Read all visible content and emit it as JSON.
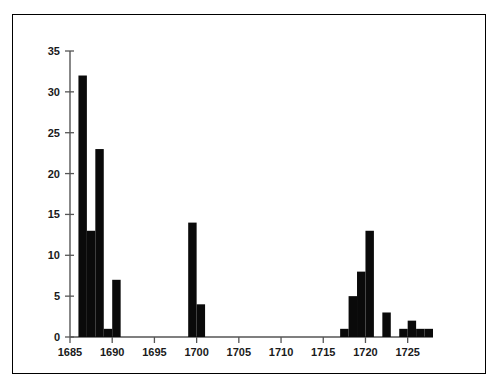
{
  "figure": {
    "background_color": "#ffffff",
    "frame_color": "#000000",
    "bar_color": "#0a0a0a",
    "axis_color": "#555555"
  },
  "chart_data": {
    "type": "bar",
    "title": "",
    "subtitle": "",
    "xlabel": "",
    "ylabel": "",
    "xlim": [
      1685,
      1728
    ],
    "ylim": [
      0,
      35
    ],
    "xticks": [
      1685,
      1690,
      1695,
      1700,
      1705,
      1710,
      1715,
      1720,
      1725
    ],
    "xtick_labels": [
      "1685",
      "1690",
      "1695",
      "1700",
      "1705",
      "1710",
      "1715",
      "1720",
      "1725"
    ],
    "yticks": [
      0,
      5,
      10,
      15,
      20,
      25,
      30,
      35
    ],
    "ytick_labels": [
      "0",
      "5",
      "10",
      "15",
      "20",
      "25",
      "30",
      "35"
    ],
    "grid": false,
    "legend": null,
    "bar_width_years": 1,
    "categories": [
      1685,
      1686,
      1687,
      1688,
      1689,
      1690,
      1691,
      1692,
      1693,
      1694,
      1695,
      1696,
      1697,
      1698,
      1699,
      1700,
      1701,
      1702,
      1703,
      1704,
      1705,
      1706,
      1707,
      1708,
      1709,
      1710,
      1711,
      1712,
      1713,
      1714,
      1715,
      1716,
      1717,
      1718,
      1719,
      1720,
      1721,
      1722,
      1723,
      1724,
      1725,
      1726,
      1727
    ],
    "values": [
      0,
      32,
      13,
      23,
      1,
      7,
      0,
      0,
      0,
      0,
      0,
      0,
      0,
      0,
      14,
      4,
      0,
      0,
      0,
      0,
      0,
      0,
      0,
      0,
      0,
      0,
      0,
      0,
      0,
      0,
      0,
      0,
      1,
      5,
      8,
      13,
      0,
      3,
      0,
      1,
      2,
      1,
      1
    ]
  }
}
